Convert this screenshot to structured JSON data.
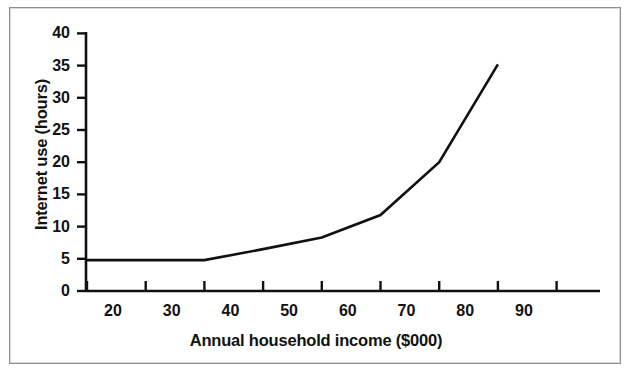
{
  "figure": {
    "border_color": "#8e8e8e",
    "background": "#ffffff"
  },
  "chart_data": {
    "type": "line",
    "title": "",
    "subtitle": "",
    "xlabel": "Annual household income ($000)",
    "ylabel": "Internet use (hours)",
    "xlim": [
      15,
      100
    ],
    "ylim": [
      0,
      40
    ],
    "grid": false,
    "legend": null,
    "line_color": "#111111",
    "line_width": 2.6,
    "markers": false,
    "x_ticks": [
      20,
      30,
      40,
      50,
      60,
      70,
      80,
      90,
      100
    ],
    "x_tick_labels": [
      "20",
      "30",
      "40",
      "50",
      "60",
      "70",
      "80",
      "90",
      ""
    ],
    "y_ticks": [
      0,
      5,
      10,
      15,
      20,
      25,
      30,
      35,
      40
    ],
    "y_tick_labels": [
      "0",
      "5",
      "10",
      "15",
      "20",
      "25",
      "30",
      "35",
      "40"
    ],
    "series": [
      {
        "name": "Internet use",
        "x": [
          20,
          40,
          50,
          60,
          70,
          80,
          90
        ],
        "values": [
          4.8,
          4.8,
          6.5,
          8.3,
          11.8,
          20.0,
          35.2
        ]
      }
    ],
    "annotations": []
  }
}
